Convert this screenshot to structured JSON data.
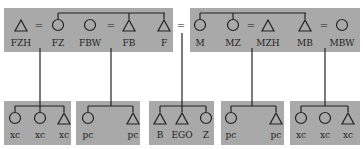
{
  "colors": {
    "box": "#a9a9a9",
    "line": "#222222"
  },
  "top_row": {
    "father_side": [
      {
        "label": "FZH",
        "sex": "male"
      },
      {
        "label": "FZ",
        "sex": "female"
      },
      {
        "label": "FBW",
        "sex": "female"
      },
      {
        "label": "FB",
        "sex": "male"
      },
      {
        "label": "F",
        "sex": "male"
      }
    ],
    "mother_side": [
      {
        "label": "M",
        "sex": "female"
      },
      {
        "label": "MZ",
        "sex": "female"
      },
      {
        "label": "MZH",
        "sex": "male"
      },
      {
        "label": "MB",
        "sex": "male"
      },
      {
        "label": "MBW",
        "sex": "female"
      }
    ]
  },
  "bottom_row": [
    {
      "group": "FZ children",
      "members": [
        {
          "label": "xc",
          "sex": "female"
        },
        {
          "label": "xc",
          "sex": "female"
        },
        {
          "label": "xc",
          "sex": "male"
        }
      ]
    },
    {
      "group": "FB children",
      "members": [
        {
          "label": "pc",
          "sex": "female"
        },
        {
          "label": "pc",
          "sex": "male"
        }
      ]
    },
    {
      "group": "siblings",
      "members": [
        {
          "label": "B",
          "sex": "male"
        },
        {
          "label": "EGO",
          "sex": "male"
        },
        {
          "label": "Z",
          "sex": "female"
        }
      ]
    },
    {
      "group": "MZ children",
      "members": [
        {
          "label": "pc",
          "sex": "female"
        },
        {
          "label": "pc",
          "sex": "male"
        }
      ]
    },
    {
      "group": "MB children",
      "members": [
        {
          "label": "xc",
          "sex": "female"
        },
        {
          "label": "xc",
          "sex": "female"
        },
        {
          "label": "xc",
          "sex": "male"
        }
      ]
    }
  ],
  "marriage_symbol": "="
}
